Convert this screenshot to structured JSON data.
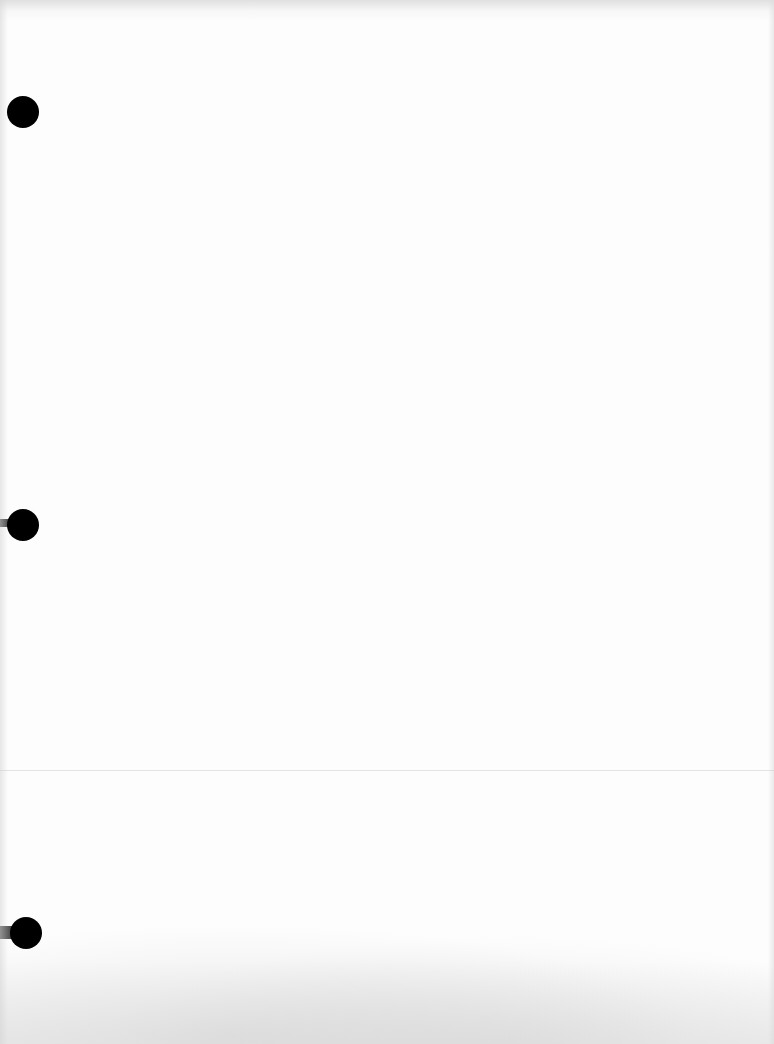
{
  "page": {
    "type": "blank scanned sheet",
    "background_color": "#fdfdfd",
    "text_content": ""
  },
  "punch_holes": [
    {
      "label": "top",
      "center_x": 23,
      "center_y": 112,
      "radius": 16,
      "color": "#000000",
      "shadow": false
    },
    {
      "label": "middle",
      "center_x": 23,
      "center_y": 525,
      "radius": 16,
      "color": "#000000",
      "shadow": true
    },
    {
      "label": "bottom",
      "center_x": 26,
      "center_y": 933,
      "radius": 16,
      "color": "#000000",
      "shadow": true
    }
  ]
}
